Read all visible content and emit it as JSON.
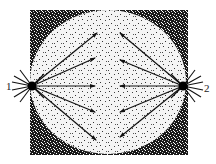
{
  "diagram": {
    "type": "cell-division-spindle",
    "colors": {
      "background": "#ffffff",
      "cytoplasm_dark": "#1a1a1a",
      "nucleus_light": "#f4f4f4",
      "ink": "#111111"
    },
    "labels": {
      "pole_1": "1",
      "pole_2": "2"
    },
    "poles": [
      {
        "id": "1",
        "x": 32,
        "y": 86
      },
      {
        "id": "2",
        "x": 183,
        "y": 86
      }
    ],
    "square": {
      "x": 30,
      "y": 10,
      "width": 158,
      "height": 145
    },
    "circle": {
      "cx": 108,
      "cy": 82,
      "rx": 78,
      "ry": 72
    },
    "spindle_fibers": {
      "from_pole_1": [
        {
          "x2": 97,
          "y2": 33
        },
        {
          "x2": 95,
          "y2": 58
        },
        {
          "x2": 95,
          "y2": 86
        },
        {
          "x2": 95,
          "y2": 112
        },
        {
          "x2": 96,
          "y2": 140
        }
      ],
      "from_pole_2": [
        {
          "x2": 120,
          "y2": 33
        },
        {
          "x2": 120,
          "y2": 60
        },
        {
          "x2": 120,
          "y2": 86
        },
        {
          "x2": 120,
          "y2": 112
        },
        {
          "x2": 120,
          "y2": 137
        }
      ]
    }
  }
}
